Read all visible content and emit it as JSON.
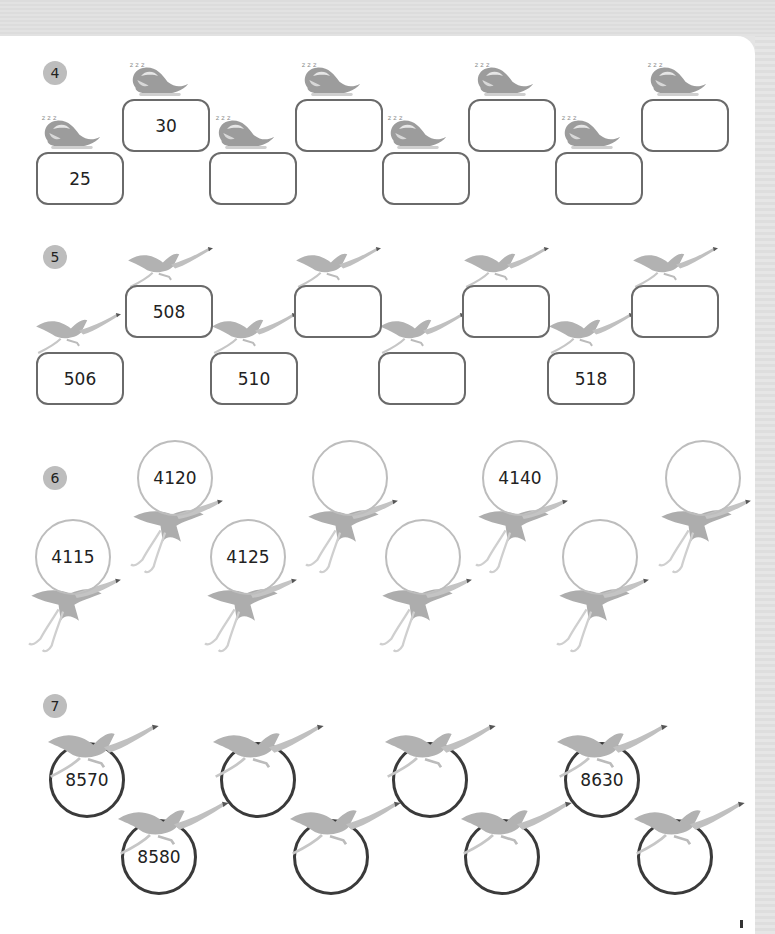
{
  "worksheet": {
    "sections": [
      {
        "number": "4",
        "shape": "rounded-rectangle",
        "decoration": "sleeping-bird-zzz",
        "values": [
          "25",
          "30",
          "",
          "",
          "",
          "",
          "",
          ""
        ]
      },
      {
        "number": "5",
        "shape": "rounded-rectangle",
        "decoration": "flying-flamingo",
        "values": [
          "506",
          "508",
          "510",
          "",
          "",
          "",
          "518",
          ""
        ]
      },
      {
        "number": "6",
        "shape": "circle-light",
        "decoration": "flamingo-balloon",
        "values": [
          "4115",
          "4120",
          "4125",
          "",
          "",
          "4140",
          "",
          ""
        ]
      },
      {
        "number": "7",
        "shape": "circle-dark",
        "decoration": "flying-flamingo",
        "values": [
          "8570",
          "8580",
          "",
          "",
          "",
          "",
          "8630",
          ""
        ]
      }
    ]
  },
  "colors": {
    "page_bg": "#e4e4e4",
    "card_bg": "#ffffff",
    "badge_bg": "#bdbdbd",
    "box_border": "#6a6a6a",
    "circle_light": "#bdbdbd",
    "circle_dark": "#3a3a3a",
    "bird": "#a8a8a8"
  }
}
